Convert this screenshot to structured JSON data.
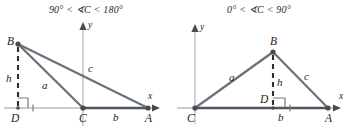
{
  "figure": {
    "caption_style": "two-panel geometry diagram of triangle ABC with altitude h",
    "colors": {
      "triangle_stroke": "#555f6b",
      "axis": "#b9bcc0",
      "dashed_altitude": "#2f2f2f",
      "label_text": "#1d1d1d",
      "title_text": "#2b2b2b",
      "base_segment": "#4c5662",
      "background": "#ffffff"
    }
  },
  "panels": [
    {
      "id": "obtuse",
      "title": "90° < ∢C < 180°",
      "title_parts": {
        "lower_bound": "90°",
        "relation_left": "<",
        "angle_symbol": "∢",
        "angle_name": "C",
        "relation_right": "<",
        "upper_bound": "180°"
      },
      "axes": {
        "x_label": "x",
        "y_label": "y"
      },
      "vertices": [
        {
          "name": "B",
          "label": "B"
        },
        {
          "name": "C",
          "label": "C"
        },
        {
          "name": "A",
          "label": "A"
        },
        {
          "name": "D",
          "label": "D"
        }
      ],
      "side_labels": [
        {
          "name": "a",
          "label": "a"
        },
        {
          "name": "b",
          "label": "b"
        },
        {
          "name": "c",
          "label": "c"
        },
        {
          "name": "h",
          "label": "h"
        }
      ],
      "marks": {
        "right_angle_at": "D",
        "altitude_foot": "D",
        "altitude_outside": true
      }
    },
    {
      "id": "acute",
      "title": "0° < ∢C < 90°",
      "title_parts": {
        "lower_bound": "0°",
        "relation_left": "<",
        "angle_symbol": "∢",
        "angle_name": "C",
        "relation_right": "<",
        "upper_bound": "90°"
      },
      "axes": {
        "x_label": "x",
        "y_label": "y"
      },
      "vertices": [
        {
          "name": "B",
          "label": "B"
        },
        {
          "name": "C",
          "label": "C"
        },
        {
          "name": "A",
          "label": "A"
        },
        {
          "name": "D",
          "label": "D"
        }
      ],
      "side_labels": [
        {
          "name": "a",
          "label": "a"
        },
        {
          "name": "b",
          "label": "b"
        },
        {
          "name": "c",
          "label": "c"
        },
        {
          "name": "h",
          "label": "h"
        }
      ],
      "marks": {
        "right_angle_at": "D",
        "altitude_foot": "D",
        "altitude_outside": false
      }
    }
  ]
}
